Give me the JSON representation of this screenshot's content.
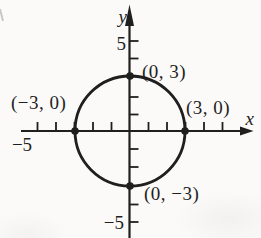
{
  "colors": {
    "ink": "#1f1f1f",
    "paper": "#fbfaf8"
  },
  "figure": {
    "type": "coordinate-plane-graph",
    "description_of_content": "circle of radius 3 centered at the origin with labeled axis intercepts",
    "axes": {
      "x_label": "x",
      "y_label": "y",
      "x_range": [
        -5,
        5
      ],
      "y_range": [
        -5,
        5
      ],
      "tick_step": 1
    },
    "tick_labels": {
      "y_positive": "5",
      "y_negative": "−5",
      "x_negative": "−5"
    },
    "circle": {
      "center_x": 0,
      "center_y": 0,
      "radius": 3
    },
    "points": [
      {
        "label": "(0, 3)",
        "x": 0,
        "y": 3
      },
      {
        "label": "(−3, 0)",
        "x": -3,
        "y": 0
      },
      {
        "label": "(3, 0)",
        "x": 3,
        "y": 0
      },
      {
        "label": "(0, −3)",
        "x": 0,
        "y": -3
      }
    ]
  }
}
